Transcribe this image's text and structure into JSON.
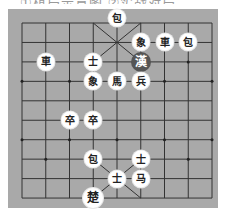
{
  "caption": "①棋局示意图  ②实战对局",
  "board": {
    "columns": 9,
    "rows": 10,
    "origin_x": 22,
    "origin_y": 23,
    "col_spacing": 23.75,
    "row_spacing": 19.45,
    "background_color": "#a9a9a9",
    "line_color": "#333333"
  },
  "pieces": [
    {
      "label": "包",
      "col": 4,
      "row": 0,
      "style": "light"
    },
    {
      "label": "象",
      "col": 5,
      "row": 1,
      "style": "light"
    },
    {
      "label": "車",
      "col": 6,
      "row": 1,
      "style": "light"
    },
    {
      "label": "包",
      "col": 7,
      "row": 1,
      "style": "light"
    },
    {
      "label": "車",
      "col": 1,
      "row": 2,
      "style": "light"
    },
    {
      "label": "士",
      "col": 3,
      "row": 2,
      "style": "light"
    },
    {
      "label": "漢",
      "col": 5,
      "row": 2,
      "style": "dark"
    },
    {
      "label": "象",
      "col": 3,
      "row": 3,
      "style": "light"
    },
    {
      "label": "馬",
      "col": 4,
      "row": 3,
      "style": "light"
    },
    {
      "label": "兵",
      "col": 5,
      "row": 3,
      "style": "light"
    },
    {
      "label": "卒",
      "col": 2,
      "row": 5,
      "style": "light"
    },
    {
      "label": "卒",
      "col": 3,
      "row": 5,
      "style": "light"
    },
    {
      "label": "包",
      "col": 3,
      "row": 7,
      "style": "light"
    },
    {
      "label": "士",
      "col": 5,
      "row": 7,
      "style": "light"
    },
    {
      "label": "士",
      "col": 4,
      "row": 8,
      "style": "light"
    },
    {
      "label": "马",
      "col": 5,
      "row": 8,
      "style": "light"
    },
    {
      "label": "楚",
      "col": 3,
      "row": 9,
      "style": "king"
    }
  ]
}
